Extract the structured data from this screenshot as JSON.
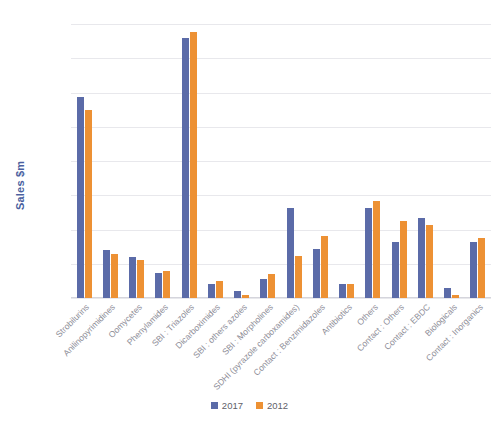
{
  "chart_data": {
    "type": "bar",
    "title": "",
    "subtitle": "",
    "xlabel": "",
    "ylabel": "Sales $m",
    "ylim": [
      0,
      4000
    ],
    "ytick_step": 500,
    "yticks": [
      0,
      500,
      1000,
      1500,
      2000,
      2500,
      3000,
      3500,
      4000
    ],
    "ytick_labels": [
      "0",
      "500",
      "1000",
      "1500",
      "2000",
      "2500",
      "3000",
      "3500",
      "4000"
    ],
    "grid": true,
    "legend_position": "bottom-center",
    "categories": [
      "Strobilurins",
      "Anilinopyrimidines",
      "Oomycetes",
      "Phenylamides",
      "SBI : Triazoles",
      "Dicarboximides",
      "SBI : others azoles",
      "SBI : Morpholines",
      "SDHI (pyrazole carboxamides)",
      "Contact : Benzimidazoles",
      "Antibiotics",
      "Others",
      "Contact : Others",
      "Contact : EBDC",
      "Biologicals",
      "Contact : Inorganics"
    ],
    "series": [
      {
        "name": "2017",
        "color": "#5b6ba8",
        "values": [
          2940,
          700,
          600,
          360,
          3800,
          210,
          100,
          280,
          1310,
          720,
          200,
          1310,
          820,
          1170,
          150,
          820
        ]
      },
      {
        "name": "2012",
        "color": "#ed9134",
        "values": [
          2750,
          645,
          560,
          400,
          3890,
          250,
          50,
          350,
          620,
          905,
          210,
          1410,
          1120,
          1070,
          40,
          870
        ]
      }
    ]
  },
  "legend": {
    "items": [
      {
        "label": "2017",
        "color": "#5b6ba8"
      },
      {
        "label": "2012",
        "color": "#ed9134"
      }
    ]
  },
  "axis": {
    "y_title": "Sales $m",
    "y_title_color": "#4a5fa0"
  }
}
